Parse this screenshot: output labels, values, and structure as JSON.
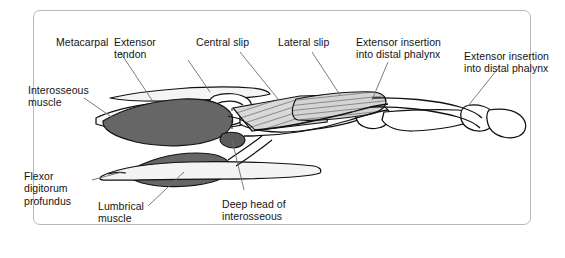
{
  "figure": {
    "border_color": "#b9b9b9",
    "background_color": "#ffffff",
    "muscle_fill": "#666666",
    "bone_fill": "#ffffff",
    "tendon_fill": "#f2f2f2",
    "hatch_fill": "#d8d8d8",
    "outline_color": "#111111",
    "leader_color": "#6d6d6d"
  },
  "labels": {
    "metacarpal": "Metacarpal",
    "extensor_tendon": "Extensor\ntendon",
    "central_slip": "Central slip",
    "lateral_slip": "Lateral slip",
    "extensor_insertion_1": "Extensor insertion\ninto distal phalynx",
    "extensor_insertion_2": "Extensor insertion\ninto distal phalynx",
    "interosseous_muscle": "Interosseous\nmuscle",
    "flexor_digitorum_profundus": "Flexor\ndigitorum\nprofundus",
    "lumbrical_muscle": "Lumbrical\nmuscle",
    "deep_head_of_interosseous": "Deep head of\ninterosseous"
  }
}
